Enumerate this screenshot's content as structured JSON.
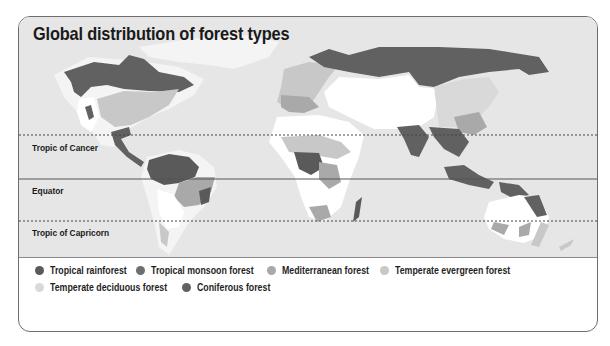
{
  "title": "Global distribution of forest types",
  "colors": {
    "ocean": "#e6e6e6",
    "land": "#f2f2f2",
    "tropical_rainforest": "#5a5a5a",
    "tropical_monsoon_forest": "#6e6e6e",
    "mediterranean_forest": "#a9a9a9",
    "temperate_evergreen_forest": "#c8c8c8",
    "temperate_deciduous_forest": "#d9d9d9",
    "coniferous_forest": "#616161",
    "other_land": "#ffffff"
  },
  "lines": [
    {
      "label": "Tropic of Cancer",
      "style": "dashed"
    },
    {
      "label": "Equator",
      "style": "solid"
    },
    {
      "label": "Tropic of Capricorn",
      "style": "dashed"
    }
  ],
  "legend": [
    {
      "label": "Tropical rainforest",
      "color": "#5a5a5a"
    },
    {
      "label": "Tropical monsoon forest",
      "color": "#6e6e6e"
    },
    {
      "label": "Mediterranean forest",
      "color": "#a9a9a9"
    },
    {
      "label": "Temperate evergreen forest",
      "color": "#c8c8c8"
    },
    {
      "label": "Temperate deciduous forest",
      "color": "#d9d9d9"
    },
    {
      "label": "Coniferous forest",
      "color": "#616161"
    }
  ]
}
